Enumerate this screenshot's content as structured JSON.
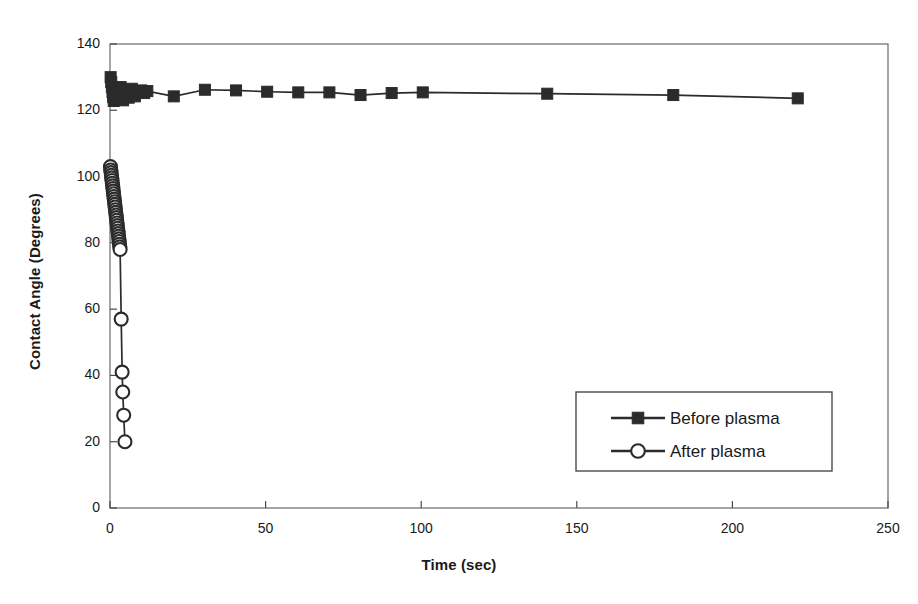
{
  "chart_data": {
    "type": "scatter",
    "title": "",
    "xlabel": "Time (sec)",
    "ylabel": "Contact Angle (Degrees)",
    "xlim": [
      0,
      250
    ],
    "ylim": [
      0,
      140
    ],
    "xticks": [
      0,
      50,
      100,
      150,
      200,
      250
    ],
    "yticks": [
      0,
      20,
      40,
      60,
      80,
      100,
      120,
      140
    ],
    "grid": false,
    "legend_position": "center-right",
    "series": [
      {
        "name": "Before plasma",
        "marker": "filled-square",
        "color": "#2b2b2b",
        "points": [
          [
            0.2,
            130.0
          ],
          [
            0.4,
            128.5
          ],
          [
            0.6,
            127.0
          ],
          [
            0.8,
            125.5
          ],
          [
            1.0,
            124.0
          ],
          [
            1.2,
            122.8
          ],
          [
            1.5,
            123.5
          ],
          [
            1.8,
            125.0
          ],
          [
            2.1,
            126.2
          ],
          [
            2.4,
            124.5
          ],
          [
            2.7,
            123.2
          ],
          [
            3.0,
            125.8
          ],
          [
            3.4,
            127.0
          ],
          [
            3.8,
            124.0
          ],
          [
            4.2,
            123.0
          ],
          [
            4.6,
            125.2
          ],
          [
            5.0,
            126.0
          ],
          [
            5.5,
            124.8
          ],
          [
            6.0,
            123.8
          ],
          [
            6.5,
            125.5
          ],
          [
            7.0,
            126.5
          ],
          [
            7.5,
            125.0
          ],
          [
            8.0,
            124.2
          ],
          [
            9.0,
            125.6
          ],
          [
            10.0,
            126.0
          ],
          [
            11.0,
            125.2
          ],
          [
            12.0,
            125.8
          ],
          [
            20.5,
            124.2
          ],
          [
            30.5,
            126.2
          ],
          [
            40.5,
            126.0
          ],
          [
            50.5,
            125.6
          ],
          [
            60.5,
            125.4
          ],
          [
            70.5,
            125.4
          ],
          [
            80.5,
            124.6
          ],
          [
            90.5,
            125.2
          ],
          [
            100.5,
            125.4
          ],
          [
            140.5,
            125.0
          ],
          [
            181.0,
            124.6
          ],
          [
            221.0,
            123.6
          ]
        ]
      },
      {
        "name": "After plasma",
        "marker": "open-circle",
        "color": "#2b2b2b",
        "points": [
          [
            0.15,
            103.0
          ],
          [
            0.25,
            102.0
          ],
          [
            0.35,
            101.2
          ],
          [
            0.45,
            100.4
          ],
          [
            0.55,
            99.6
          ],
          [
            0.65,
            98.8
          ],
          [
            0.75,
            98.0
          ],
          [
            0.85,
            97.2
          ],
          [
            0.95,
            96.4
          ],
          [
            1.05,
            95.6
          ],
          [
            1.15,
            94.8
          ],
          [
            1.25,
            94.0
          ],
          [
            1.35,
            93.2
          ],
          [
            1.45,
            92.4
          ],
          [
            1.55,
            91.6
          ],
          [
            1.65,
            90.8
          ],
          [
            1.75,
            90.0
          ],
          [
            1.85,
            89.2
          ],
          [
            1.95,
            88.4
          ],
          [
            2.05,
            87.6
          ],
          [
            2.15,
            86.8
          ],
          [
            2.25,
            86.0
          ],
          [
            2.35,
            85.2
          ],
          [
            2.45,
            84.4
          ],
          [
            2.55,
            83.6
          ],
          [
            2.65,
            82.8
          ],
          [
            2.75,
            82.0
          ],
          [
            2.85,
            81.2
          ],
          [
            2.95,
            80.4
          ],
          [
            3.05,
            79.6
          ],
          [
            3.15,
            78.8
          ],
          [
            3.25,
            78.0
          ],
          [
            3.6,
            57.0
          ],
          [
            3.9,
            41.0
          ],
          [
            4.1,
            35.0
          ],
          [
            4.4,
            28.0
          ],
          [
            4.8,
            20.0
          ]
        ]
      }
    ]
  },
  "legend": {
    "items": [
      {
        "label": "Before plasma",
        "marker": "filled-square"
      },
      {
        "label": "After plasma",
        "marker": "open-circle"
      }
    ]
  },
  "axes": {
    "x_title": "Time (sec)",
    "y_title": "Contact Angle (Degrees)",
    "x_tick_labels": [
      "0",
      "50",
      "100",
      "150",
      "200",
      "250"
    ],
    "y_tick_labels": [
      "0",
      "20",
      "40",
      "60",
      "80",
      "100",
      "120",
      "140"
    ]
  },
  "colors": {
    "ink": "#2b2b2b",
    "frame": "#6a6a6a",
    "background": "#ffffff"
  }
}
